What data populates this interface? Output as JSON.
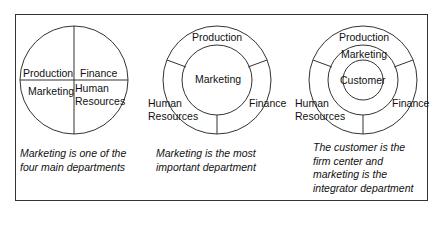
{
  "panels": [
    {
      "id": "panel-1",
      "labels": {
        "production": "Production",
        "finance": "Finance",
        "marketing": "Marketing",
        "human_resources_1": "Human",
        "human_resources_2": "Resources"
      },
      "caption": [
        "Marketing is one of the",
        "four main departments"
      ]
    },
    {
      "id": "panel-2",
      "labels": {
        "production": "Production",
        "marketing": "Marketing",
        "human_resources_1": "Human",
        "human_resources_2": "Resources",
        "finance": "Finance"
      },
      "caption": [
        "Marketing is the most",
        "important department"
      ]
    },
    {
      "id": "panel-3",
      "labels": {
        "production": "Production",
        "marketing": "Marketing",
        "customer": "Customer",
        "human_resources_1": "Human",
        "human_resources_2": "Resources",
        "finance": "Finance"
      },
      "caption": [
        "The customer is the",
        "firm center and",
        "marketing is the",
        "integrator department"
      ]
    }
  ],
  "colors": {
    "stroke": "#333333",
    "text": "#111111",
    "background": "#ffffff"
  }
}
